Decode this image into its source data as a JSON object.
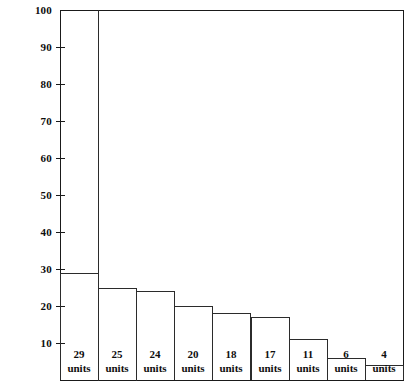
{
  "chart_data": {
    "type": "bar",
    "title": "",
    "subtitle": "",
    "xlabel": "",
    "ylabel": "",
    "ylim": [
      0,
      100
    ],
    "xlim": [
      0,
      9
    ],
    "grid": false,
    "legend": null,
    "y_ticks": [
      100,
      90,
      80,
      70,
      60,
      50,
      40,
      30,
      20,
      10
    ],
    "y_tick_labels": [
      "100",
      "90",
      "80",
      "70",
      "60",
      "50",
      "40",
      "30",
      "20",
      "10"
    ],
    "categories": [
      "1",
      "2",
      "3",
      "4",
      "5",
      "6",
      "7",
      "8",
      "9"
    ],
    "values": [
      29,
      25,
      24,
      20,
      18,
      17,
      11,
      6,
      4
    ],
    "data_labels": [
      "29 units",
      "25 units",
      "24 units",
      "20 units",
      "18 units",
      "17 units",
      "11 units",
      "6 units",
      "4 units"
    ],
    "bars": [
      {
        "value": 29,
        "value_text": "29",
        "unit_text": "units"
      },
      {
        "value": 25,
        "value_text": "25",
        "unit_text": "units"
      },
      {
        "value": 24,
        "value_text": "24",
        "unit_text": "units"
      },
      {
        "value": 20,
        "value_text": "20",
        "unit_text": "units"
      },
      {
        "value": 18,
        "value_text": "18",
        "unit_text": "units"
      },
      {
        "value": 17,
        "value_text": "17",
        "unit_text": "units"
      },
      {
        "value": 16,
        "value_text": "17",
        "unit_text": "units"
      },
      {
        "value": 11,
        "value_text": "11",
        "unit_text": "units"
      },
      {
        "value": 6,
        "value_text": "6",
        "unit_text": "units"
      },
      {
        "value": 4,
        "value_text": "4",
        "unit_text": "units"
      }
    ],
    "colors": {
      "axis": "#1a1a1a",
      "bar_outline": "#2b2b2b",
      "bar_fill": "#ffffff",
      "background": "#ffffff",
      "text": "#0d0d0d"
    }
  },
  "axis": {
    "y_tick_labels": [
      "100",
      "90",
      "80",
      "70",
      "60",
      "50",
      "40",
      "30",
      "20",
      "10"
    ]
  },
  "bars": [
    {
      "value_text": "29",
      "unit_text": "units"
    },
    {
      "value_text": "25",
      "unit_text": "units"
    },
    {
      "value_text": "24",
      "unit_text": "units"
    },
    {
      "value_text": "20",
      "unit_text": "units"
    },
    {
      "value_text": "18",
      "unit_text": "units"
    },
    {
      "value_text": "17",
      "unit_text": "units"
    },
    {
      "value_text": "11",
      "unit_text": "units"
    },
    {
      "value_text": "6",
      "unit_text": "units"
    },
    {
      "value_text": "4",
      "unit_text": "units"
    }
  ]
}
